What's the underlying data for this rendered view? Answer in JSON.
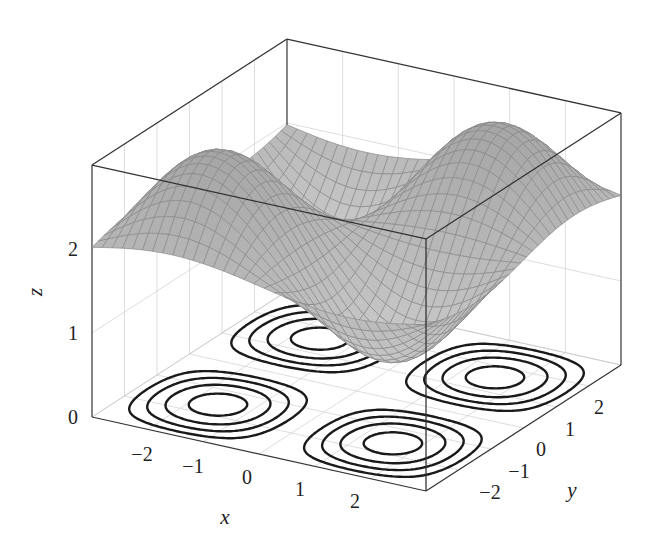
{
  "chart_data": {
    "type": "surface3d",
    "title": "",
    "function": "z = sin(x)*sin(y) + 2",
    "contour_function": "sin(x)*sin(y) drawn on plane z = 0",
    "xlabel": "x",
    "ylabel": "y",
    "zlabel": "z",
    "xlim": [
      -3,
      3
    ],
    "ylim": [
      -3,
      3
    ],
    "zlim": [
      0,
      3
    ],
    "xticks": [
      -2,
      -1,
      0,
      1,
      2
    ],
    "yticks": [
      -2,
      -1,
      0,
      1,
      2
    ],
    "zticks": [
      0,
      1,
      2
    ],
    "xtick_labels": [
      "−2",
      "−1",
      "0",
      "1",
      "2"
    ],
    "ytick_labels": [
      "−2",
      "−1",
      "0",
      "1",
      "2"
    ],
    "ztick_labels": [
      "0",
      "1",
      "2"
    ],
    "contour_levels": [
      -0.9,
      -0.7,
      -0.5,
      -0.3,
      0.3,
      0.5,
      0.7,
      0.9
    ],
    "contour_groups": 4,
    "rings_per_group": 4,
    "mesh_samples": 33,
    "grid": true,
    "box": true,
    "colors": {
      "surface_fill": "#b8b8b8",
      "surface_mesh": "#8a8a8a",
      "contour": "#1a1a1a",
      "box": "#333333",
      "grid": "#d4d4d4"
    }
  }
}
